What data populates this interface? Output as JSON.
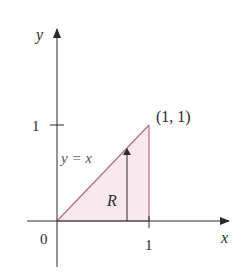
{
  "diagram": {
    "type": "region-of-integration",
    "axes": {
      "x_label": "x",
      "y_label": "y",
      "origin_label": "0",
      "x_tick_label": "1",
      "y_tick_label": "1"
    },
    "curve_label": "y = x",
    "region_label": "R",
    "point_label": "(1, 1)",
    "region_vertices": [
      [
        0,
        0
      ],
      [
        1,
        0
      ],
      [
        1,
        1
      ]
    ],
    "colors": {
      "region_fill": "#f9e9ef",
      "region_edge": "#b56a84",
      "axis": "#2a2a2a"
    }
  }
}
